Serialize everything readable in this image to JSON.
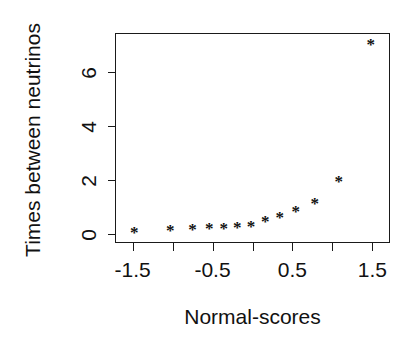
{
  "chart_data": {
    "type": "scatter",
    "title": "",
    "xlabel": "Normal-scores",
    "ylabel": "Times between neutrinos",
    "xlim": [
      -1.72,
      1.72
    ],
    "ylim": [
      -0.35,
      7.45
    ],
    "xticks": [
      -1.5,
      -1.0,
      -0.5,
      0.0,
      0.5,
      1.0,
      1.5
    ],
    "xtick_labels": [
      "-1.5",
      "",
      "-0.5",
      "",
      "0.5",
      "",
      "1.5"
    ],
    "yticks": [
      0,
      2,
      4,
      6
    ],
    "ytick_labels": [
      "0",
      "2",
      "4",
      "6"
    ],
    "grid": false,
    "legend": false,
    "marker": "*",
    "marker_color": "#111111",
    "frame_color": "#1a1a1a",
    "background": "#ffffff",
    "x": [
      -1.48,
      -1.03,
      -0.75,
      -0.54,
      -0.36,
      -0.19,
      -0.02,
      0.16,
      0.34,
      0.54,
      0.78,
      1.08,
      1.48
    ],
    "y": [
      0.02,
      0.08,
      0.14,
      0.16,
      0.16,
      0.22,
      0.26,
      0.42,
      0.58,
      0.8,
      1.1,
      1.92,
      7.0
    ],
    "points": [
      {
        "x": -1.48,
        "y": 0.02
      },
      {
        "x": -1.03,
        "y": 0.08
      },
      {
        "x": -0.75,
        "y": 0.14
      },
      {
        "x": -0.54,
        "y": 0.16
      },
      {
        "x": -0.36,
        "y": 0.16
      },
      {
        "x": -0.19,
        "y": 0.22
      },
      {
        "x": -0.02,
        "y": 0.26
      },
      {
        "x": 0.16,
        "y": 0.42
      },
      {
        "x": 0.34,
        "y": 0.58
      },
      {
        "x": 0.54,
        "y": 0.8
      },
      {
        "x": 0.78,
        "y": 1.1
      },
      {
        "x": 1.08,
        "y": 1.92
      },
      {
        "x": 1.48,
        "y": 7.0
      }
    ]
  },
  "axes": {
    "x_title": "Normal-scores",
    "y_title": "Times between neutrinos"
  }
}
